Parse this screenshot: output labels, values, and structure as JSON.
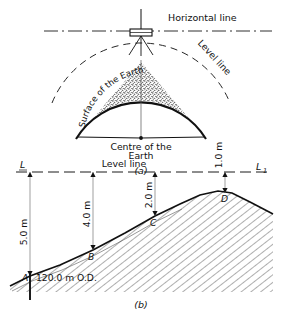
{
  "figure": {
    "caption_a": "(a)",
    "caption_b": "(b)"
  },
  "panel_a": {
    "name": "earth-curvature-diagram",
    "labels": {
      "horizontal_line": "Horizontal line",
      "level_line": "Level line",
      "surface_of_earth": "Surface of the Earth",
      "centre_of_earth_line1": "Centre of the",
      "centre_of_earth_line2": "Earth"
    },
    "icons": {
      "instrument": "surveying-level-instrument-icon"
    }
  },
  "panel_b": {
    "name": "level-line-ground-profile-diagram",
    "labels": {
      "line_left": "L",
      "line_right": "L",
      "line_right_sub": "1",
      "level_line": "Level line",
      "datum_note": "120.0 m  O.D."
    },
    "stations": [
      {
        "id": "A",
        "label": "A",
        "staff_reading": "5.0 m",
        "x": 30,
        "ground_y": 276
      },
      {
        "id": "B",
        "label": "B",
        "staff_reading": "4.0 m",
        "x": 93,
        "ground_y": 250
      },
      {
        "id": "C",
        "label": "C",
        "staff_reading": "2.0 m",
        "x": 155,
        "ground_y": 216
      },
      {
        "id": "D",
        "label": "D",
        "staff_reading": "1.0 m",
        "x": 225,
        "ground_y": 196
      }
    ],
    "level_line_y": 172
  }
}
